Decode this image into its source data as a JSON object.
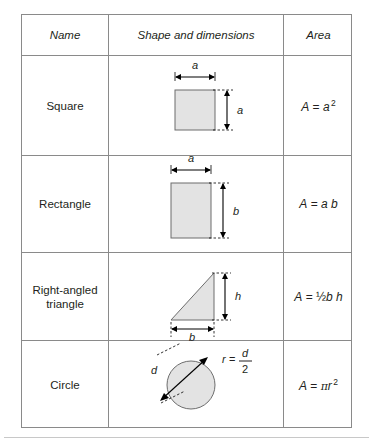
{
  "table": {
    "headers": {
      "name": "Name",
      "shape": "Shape and dimensions",
      "area": "Area"
    },
    "rows": [
      {
        "id": "square",
        "name": "Square",
        "area_formula": "A = a 2",
        "area_parts": {
          "lhs": "A",
          "eq": "=",
          "base": "a",
          "exponent": "2"
        },
        "dimensions": [
          {
            "label": "a",
            "position": "top"
          },
          {
            "label": "a",
            "position": "right"
          }
        ]
      },
      {
        "id": "rectangle",
        "name": "Rectangle",
        "area_formula": "A = a b",
        "area_parts": {
          "lhs": "A",
          "eq": "=",
          "factor1": "a",
          "factor2": "b"
        },
        "dimensions": [
          {
            "label": "a",
            "position": "top"
          },
          {
            "label": "b",
            "position": "right"
          }
        ]
      },
      {
        "id": "right-angled-triangle",
        "name_line1": "Right-angled",
        "name_line2": "triangle",
        "area_formula": "A = ½ b h",
        "area_parts": {
          "lhs": "A",
          "eq": "=",
          "fraction": "½",
          "factor1": "b",
          "factor2": "h"
        },
        "dimensions": [
          {
            "label": "h",
            "position": "right"
          },
          {
            "label": "b",
            "position": "bottom"
          }
        ]
      },
      {
        "id": "circle",
        "name": "Circle",
        "area_formula": "A = π r 2",
        "area_parts": {
          "lhs": "A",
          "eq": "=",
          "pi": "π",
          "base": "r",
          "exponent": "2"
        },
        "dimensions": [
          {
            "label": "d",
            "position": "diameter"
          }
        ],
        "annotation": {
          "lhs": "r",
          "eq": "=",
          "numerator": "d",
          "denominator": "2"
        }
      }
    ]
  },
  "colors": {
    "border": "#8a8a8a",
    "shape_fill": "#e3e3e3",
    "shape_stroke": "#6d6d6d",
    "text": "#231f20",
    "page_rule": "#c8c8c8"
  }
}
